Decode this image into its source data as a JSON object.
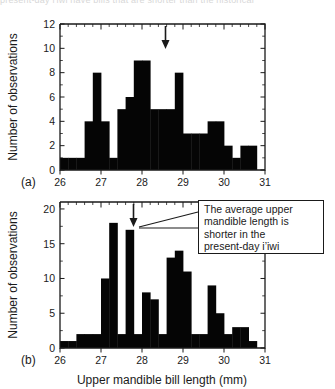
{
  "figure": {
    "cut_off_header_text": "present-day i'iwi have bills that are shorter than the historical",
    "xlabel": "Upper mandible bill length (mm)",
    "ylabel": "Number of observations",
    "annotation": "The average upper mandible length is shorter in the present-day i’iwi",
    "annotation_lines": [
      "The average upper",
      "mandible length is",
      "shorter in the",
      "present-day i’iwi"
    ],
    "panel_a_label": "(a)",
    "panel_b_label": "(b)",
    "ink_color": "#050505",
    "axis_color": "#1a1a1a",
    "background": "#ffffff"
  },
  "chart_data": [
    {
      "type": "bar",
      "panel": "(a)",
      "title": "",
      "xlabel": "Upper mandible bill length (mm)",
      "ylabel": "Number of observations",
      "xlim": [
        26,
        31
      ],
      "ylim": [
        0,
        12
      ],
      "xticks": [
        26,
        27,
        28,
        29,
        30,
        31
      ],
      "yticks": [
        0,
        2,
        4,
        6,
        8,
        10,
        12
      ],
      "bin_width": 0.2,
      "grid": false,
      "legend": null,
      "mean_arrow_x": 28.6,
      "bin_starts": [
        26.0,
        26.2,
        26.4,
        26.6,
        26.8,
        27.0,
        27.2,
        27.4,
        27.6,
        27.8,
        28.0,
        28.2,
        28.4,
        28.6,
        28.8,
        29.0,
        29.2,
        29.4,
        29.6,
        29.8,
        30.0,
        30.2,
        30.4,
        30.6,
        30.8
      ],
      "values": [
        1,
        1,
        1,
        4,
        8,
        4,
        1,
        5,
        6,
        9,
        9,
        5,
        5,
        5,
        8,
        3,
        3,
        3,
        4,
        4,
        2,
        1,
        2,
        2,
        0
      ]
    },
    {
      "type": "bar",
      "panel": "(b)",
      "title": "",
      "xlabel": "Upper mandible bill length (mm)",
      "ylabel": "Number of observations",
      "xlim": [
        26,
        31
      ],
      "ylim": [
        0,
        21
      ],
      "xticks": [
        26,
        27,
        28,
        29,
        30,
        31
      ],
      "yticks": [
        0,
        5,
        10,
        15,
        20
      ],
      "bin_width": 0.2,
      "grid": false,
      "legend": null,
      "mean_arrow_x": 27.55,
      "bin_starts": [
        26.0,
        26.2,
        26.4,
        26.6,
        26.8,
        27.0,
        27.2,
        27.4,
        27.6,
        27.8,
        28.0,
        28.2,
        28.4,
        28.6,
        28.8,
        29.0,
        29.2,
        29.4,
        29.6,
        29.8,
        30.0,
        30.2,
        30.4,
        30.6,
        30.8
      ],
      "values": [
        1,
        1,
        2,
        2,
        2,
        10,
        18,
        2,
        17,
        2,
        8,
        7,
        2,
        13,
        14,
        11,
        2,
        2,
        9,
        5,
        2,
        3,
        3,
        1,
        0
      ]
    }
  ]
}
